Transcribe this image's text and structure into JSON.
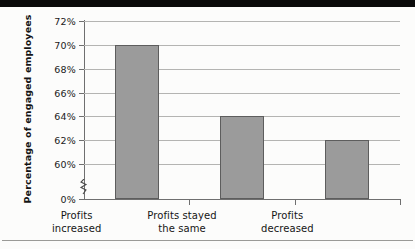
{
  "chart_data": {
    "type": "bar",
    "title": "",
    "subtitle": "",
    "xlabel": "",
    "ylabel": "Percentage of engaged employees",
    "ylabel_line1": "Percentage of engaged",
    "ylabel_line2": "employees",
    "categories": [
      "Profits increased",
      "Profits stayed the same",
      "Profits decreased"
    ],
    "category_lines": [
      [
        "Profits",
        "increased"
      ],
      [
        "Profits stayed",
        "the same"
      ],
      [
        "Profits",
        "decreased"
      ]
    ],
    "values": [
      70,
      64,
      62
    ],
    "value_labels": [
      "70%",
      "64%",
      "62%"
    ],
    "ylim": [
      58,
      72
    ],
    "axis_break": true,
    "axis_break_between": [
      "0%",
      "60%"
    ],
    "ytick_labels": [
      "72%",
      "70%",
      "68%",
      "66%",
      "64%",
      "62%",
      "60%",
      "0%"
    ],
    "yticks": [
      72,
      70,
      68,
      66,
      64,
      62,
      60,
      0
    ],
    "grid": true,
    "grid_axis": "y",
    "legend": "none",
    "bar_color": "#9b9b9b",
    "bar_edge_color": "#5d5d5d",
    "grid_color": "#b4b4b2",
    "axis_color": "#6f6f6f",
    "background_color": "#fcfcfb",
    "text_color": "#151515"
  },
  "decoration": {
    "top_band_color": "#0a0a0a",
    "bottom_rule_color": "#9a9a97"
  }
}
